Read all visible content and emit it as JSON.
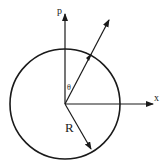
{
  "diagram": {
    "labels": {
      "vertical_axis": "p",
      "horizontal_axis": "x",
      "angle": "θ",
      "radius": "R"
    },
    "colors": {
      "stroke": "#1a1a1a",
      "background": "#ffffff"
    }
  }
}
